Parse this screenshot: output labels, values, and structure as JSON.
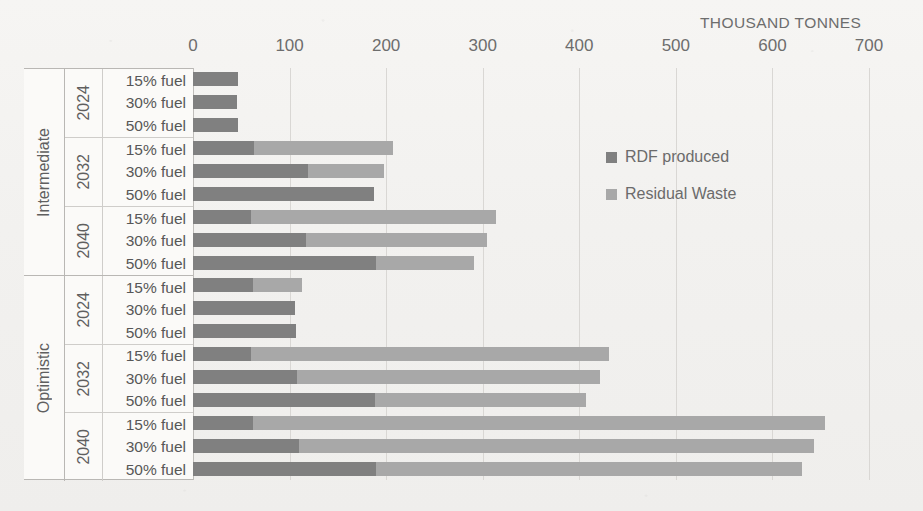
{
  "chart_data": {
    "type": "bar",
    "orientation": "horizontal",
    "stacked": true,
    "title": "",
    "xlabel": "THOUSAND TONNES",
    "ylabel": "",
    "xlim": [
      0,
      700
    ],
    "xticks": [
      0,
      100,
      200,
      300,
      400,
      500,
      600,
      700
    ],
    "grid": true,
    "legend_position": "inside-right",
    "legend": [
      "RDF produced",
      "Residual Waste"
    ],
    "series": [
      {
        "name": "RDF produced",
        "color": "#808080",
        "values": [
          47,
          46,
          47,
          63,
          119,
          187,
          60,
          117,
          190,
          62,
          106,
          107,
          60,
          108,
          188,
          62,
          110,
          190
        ]
      },
      {
        "name": "Residual Waste",
        "color": "#a8a8a8",
        "values": [
          0,
          0,
          0,
          144,
          79,
          0,
          254,
          187,
          101,
          51,
          0,
          0,
          371,
          313,
          219,
          592,
          533,
          441
        ]
      }
    ],
    "categories": [
      "Intermediate / 2024 / 15% fuel",
      "Intermediate / 2024 / 30% fuel",
      "Intermediate / 2024 / 50% fuel",
      "Intermediate / 2032 / 15% fuel",
      "Intermediate / 2032 / 30% fuel",
      "Intermediate / 2032 / 50% fuel",
      "Intermediate / 2040 / 15% fuel",
      "Intermediate / 2040 / 30% fuel",
      "Intermediate / 2040 / 50% fuel",
      "Optimistic / 2024 / 15% fuel",
      "Optimistic / 2024 / 30% fuel",
      "Optimistic / 2024 / 50% fuel",
      "Optimistic / 2032 / 15% fuel",
      "Optimistic / 2032 / 30% fuel",
      "Optimistic / 2032 / 50% fuel",
      "Optimistic / 2040 / 15% fuel",
      "Optimistic / 2040 / 30% fuel",
      "Optimistic / 2040 / 50% fuel"
    ],
    "totals": [
      47,
      46,
      47,
      207,
      198,
      187,
      314,
      304,
      291,
      113,
      106,
      107,
      431,
      421,
      407,
      654,
      643,
      631
    ]
  },
  "axis": {
    "unit_label": "THOUSAND TONNES",
    "ticks": [
      "0",
      "100",
      "200",
      "300",
      "400",
      "500",
      "600",
      "700"
    ]
  },
  "legend": {
    "items": [
      {
        "label": "RDF produced",
        "color": "#808080"
      },
      {
        "label": "Residual Waste",
        "color": "#a8a8a8"
      }
    ]
  },
  "scenarios": [
    {
      "name": "Intermediate",
      "years": [
        {
          "year": "2024",
          "fuels": [
            "15% fuel",
            "30% fuel",
            "50% fuel"
          ]
        },
        {
          "year": "2032",
          "fuels": [
            "15% fuel",
            "30% fuel",
            "50% fuel"
          ]
        },
        {
          "year": "2040",
          "fuels": [
            "15% fuel",
            "30% fuel",
            "50% fuel"
          ]
        }
      ]
    },
    {
      "name": "Optimistic",
      "years": [
        {
          "year": "2024",
          "fuels": [
            "15% fuel",
            "30% fuel",
            "50% fuel"
          ]
        },
        {
          "year": "2032",
          "fuels": [
            "15% fuel",
            "30% fuel",
            "50% fuel"
          ]
        },
        {
          "year": "2040",
          "fuels": [
            "15% fuel",
            "30% fuel",
            "50% fuel"
          ]
        }
      ]
    }
  ]
}
